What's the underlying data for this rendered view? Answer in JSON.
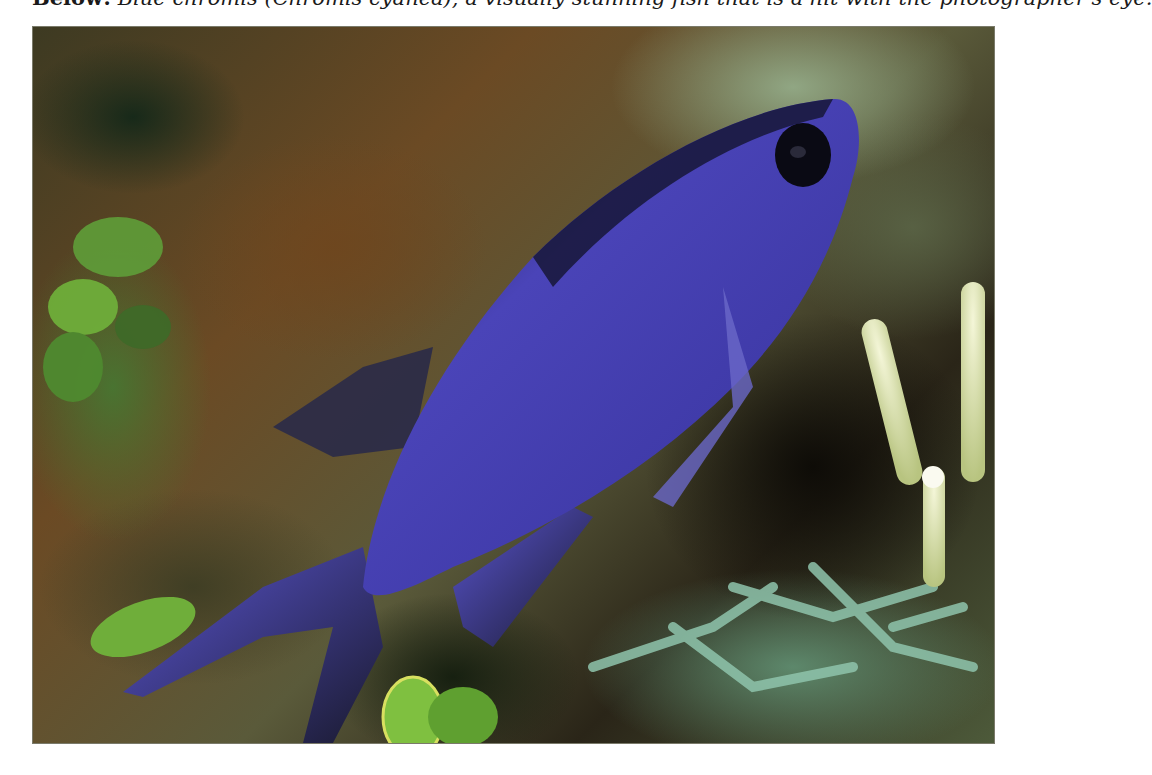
{
  "caption": {
    "label": "Below:",
    "text": "Blue chromis (Chromis cyanea), a visually stunning fish that is a hit with the photographer's eye.",
    "visible": "clipped-top-line"
  },
  "photo": {
    "subject": "blue chromis fish on reef",
    "alt": "A vivid blue-violet chromis fish swimming over a reef with brown algae, green sea grapes and pale finger sponges",
    "colors": {
      "fish_body": "#4a44b8",
      "fish_dark": "#141430",
      "fish_eye": "#0a0a14",
      "algae_brown": "#6b4a24",
      "plant_green": "#6fae3a",
      "coral_pale": "#e0e6b0",
      "seaweed_teal": "#7fb5a0"
    }
  }
}
